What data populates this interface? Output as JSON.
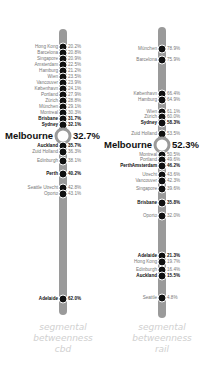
{
  "chart_data": [
    {
      "type": "dot-strip",
      "title": "segmental betweenness cbd",
      "caption_lines": [
        "segmental",
        "betweenness",
        "cbd"
      ],
      "unit": "%",
      "highlight": "Melbourne",
      "points": [
        {
          "name": "Hong Kong",
          "value": 20.2,
          "y": 47,
          "bold": false
        },
        {
          "name": "Barcelona",
          "value": 20.8,
          "y": 53,
          "bold": false
        },
        {
          "name": "Singapore",
          "value": 20.9,
          "y": 59,
          "bold": false
        },
        {
          "name": "Amsterdam",
          "value": 22.5,
          "y": 65,
          "bold": false
        },
        {
          "name": "Hamburg",
          "value": 21.2,
          "y": 71,
          "bold": false
        },
        {
          "name": "Wien",
          "value": 23.5,
          "y": 77,
          "bold": false
        },
        {
          "name": "Vancouver",
          "value": 23.9,
          "y": 83,
          "bold": false
        },
        {
          "name": "København",
          "value": 24.1,
          "y": 89,
          "bold": false
        },
        {
          "name": "Portland",
          "value": 27.9,
          "y": 95,
          "bold": false
        },
        {
          "name": "Zürich",
          "value": 28.8,
          "y": 101,
          "bold": false
        },
        {
          "name": "München",
          "value": 29.1,
          "y": 107,
          "bold": false
        },
        {
          "name": "Montreal",
          "value": 30.3,
          "y": 113,
          "bold": false
        },
        {
          "name": "Brisbane",
          "value": 31.7,
          "y": 119,
          "bold": true
        },
        {
          "name": "Sydney",
          "value": 32.1,
          "y": 125,
          "bold": true
        },
        {
          "name": "Melbourne",
          "value": 32.7,
          "y": 136,
          "bold": true,
          "highlight": true
        },
        {
          "name": "Auckland",
          "value": 35.7,
          "y": 146,
          "bold": true
        },
        {
          "name": "Zuid Holland",
          "value": 36.3,
          "y": 152,
          "bold": false
        },
        {
          "name": "Edinburgh",
          "value": 38.1,
          "y": 161,
          "bold": false
        },
        {
          "name": "Perth",
          "value": 40.2,
          "y": 174,
          "bold": true
        },
        {
          "name": "Seattle  Utrecht",
          "value": 42.8,
          "y": 188,
          "bold": false
        },
        {
          "name": "Oporto",
          "value": 43.1,
          "y": 194,
          "bold": false
        },
        {
          "name": "Adelaide",
          "value": 62.0,
          "y": 299,
          "bold": true
        }
      ]
    },
    {
      "type": "dot-strip",
      "title": "segmental betweenness rail",
      "caption_lines": [
        "segmental",
        "betweenness",
        "rail"
      ],
      "unit": "%",
      "highlight": "Melbourne",
      "points": [
        {
          "name": "München",
          "value": 78.9,
          "y": 49,
          "bold": false
        },
        {
          "name": "Barcelona",
          "value": 75.9,
          "y": 60,
          "bold": false
        },
        {
          "name": "København",
          "value": 66.4,
          "y": 94,
          "bold": false
        },
        {
          "name": "Hamburg",
          "value": 64.9,
          "y": 100,
          "bold": false
        },
        {
          "name": "Wien",
          "value": 61.1,
          "y": 112,
          "bold": false
        },
        {
          "name": "Zürich",
          "value": 60.0,
          "y": 117,
          "bold": false
        },
        {
          "name": "Sydney",
          "value": 58.3,
          "y": 123,
          "bold": true
        },
        {
          "name": "Zuid Holland",
          "value": 53.5,
          "y": 134,
          "bold": false
        },
        {
          "name": "Melbourne",
          "value": 52.3,
          "y": 145,
          "bold": true,
          "highlight": true
        },
        {
          "name": "Montreal",
          "value": 50.5,
          "y": 155,
          "bold": false
        },
        {
          "name": "Portland",
          "value": 49.6,
          "y": 160,
          "bold": false
        },
        {
          "name": "Amsterdam",
          "value": 46.2,
          "y": 166,
          "bold": true,
          "extra_left": "Perth"
        },
        {
          "name": "Utrecht",
          "value": 43.6,
          "y": 175,
          "bold": false
        },
        {
          "name": "Vancouver",
          "value": 42.3,
          "y": 181,
          "bold": false
        },
        {
          "name": "Singapore",
          "value": 39.6,
          "y": 189,
          "bold": false
        },
        {
          "name": "Brisbane",
          "value": 35.8,
          "y": 203,
          "bold": true
        },
        {
          "name": "Oporto",
          "value": 32.0,
          "y": 216,
          "bold": false
        },
        {
          "name": "Adelaide",
          "value": 21.3,
          "y": 256,
          "bold": true
        },
        {
          "name": "Hong Kong",
          "value": 19.7,
          "y": 262,
          "bold": false
        },
        {
          "name": "Edinburgh",
          "value": 16.4,
          "y": 270,
          "bold": false
        },
        {
          "name": "Auckland",
          "value": 15.5,
          "y": 276,
          "bold": true
        },
        {
          "name": "Seattle",
          "value": 4.8,
          "y": 298,
          "bold": false
        }
      ]
    }
  ],
  "layout": {
    "left": {
      "bar_x": 63,
      "bar_top": 29,
      "bar_bottom": 315,
      "cap_x": 13,
      "cap_y": 322
    },
    "right": {
      "bar_x": 162,
      "bar_top": 27,
      "bar_bottom": 318,
      "cap_x": 112,
      "cap_y": 322
    },
    "colors": {
      "bar": "#9a9a9a",
      "dot": "#111111",
      "label": "#777777",
      "bold_label": "#111111",
      "caption": "#d0d0d0"
    }
  }
}
